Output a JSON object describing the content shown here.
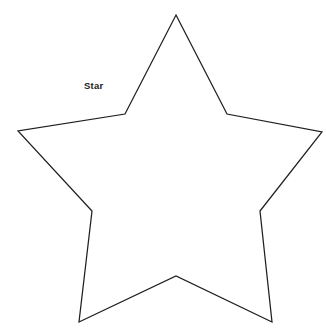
{
  "page": {
    "background_color": "#ffffff",
    "width": 326,
    "height": 330
  },
  "diagram": {
    "title_label": "Star",
    "label_position": {
      "x": 84,
      "y": 81
    },
    "outline_color": "#1f1f1f",
    "fold_line_color": "#9a9a9a",
    "fill_color": "#ffffff",
    "center": {
      "x": 176,
      "y": 186
    },
    "outer_points": [
      {
        "name": "top",
        "x": 176,
        "y": 15
      },
      {
        "name": "right",
        "x": 322,
        "y": 132
      },
      {
        "name": "bottom-right",
        "x": 272,
        "y": 322
      },
      {
        "name": "bottom-left",
        "x": 79,
        "y": 322
      },
      {
        "name": "left",
        "x": 18,
        "y": 131
      }
    ],
    "inner_points": [
      {
        "name": "upper-right",
        "x": 227,
        "y": 114
      },
      {
        "name": "lower-right",
        "x": 260,
        "y": 211
      },
      {
        "name": "bottom",
        "x": 176,
        "y": 276
      },
      {
        "name": "lower-left",
        "x": 92,
        "y": 211
      },
      {
        "name": "upper-left",
        "x": 125,
        "y": 114
      }
    ],
    "outline_path": "M176,15 L227,114 L322,132 L260,211 L272,322 L176,276 L79,322 L92,211 L18,131 L125,114 Z",
    "fold_lines": [
      {
        "name": "fold-to-top",
        "x1": 176,
        "y1": 186,
        "x2": 176,
        "y2": 15
      },
      {
        "name": "fold-to-right",
        "x1": 176,
        "y1": 186,
        "x2": 322,
        "y2": 132
      },
      {
        "name": "fold-to-bottom-right",
        "x1": 176,
        "y1": 186,
        "x2": 272,
        "y2": 322
      },
      {
        "name": "fold-to-bottom-left",
        "x1": 176,
        "y1": 186,
        "x2": 79,
        "y2": 322
      },
      {
        "name": "fold-to-left",
        "x1": 176,
        "y1": 186,
        "x2": 18,
        "y2": 131
      },
      {
        "name": "fold-to-inner-upper-right",
        "x1": 176,
        "y1": 186,
        "x2": 227,
        "y2": 114
      },
      {
        "name": "fold-to-inner-lower-right",
        "x1": 176,
        "y1": 186,
        "x2": 260,
        "y2": 211
      },
      {
        "name": "fold-to-inner-bottom",
        "x1": 176,
        "y1": 186,
        "x2": 176,
        "y2": 276
      },
      {
        "name": "fold-to-inner-lower-left",
        "x1": 176,
        "y1": 186,
        "x2": 92,
        "y2": 211
      },
      {
        "name": "fold-to-inner-upper-left",
        "x1": 176,
        "y1": 186,
        "x2": 125,
        "y2": 114
      }
    ]
  }
}
